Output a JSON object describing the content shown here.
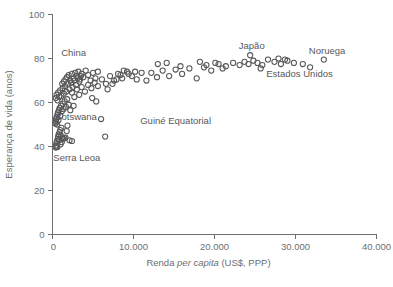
{
  "chart_data": {
    "type": "scatter",
    "title": "",
    "xlabel_parts": {
      "pre": "Renda ",
      "italic": "per capita",
      "post": " (US$, PPP)"
    },
    "xlabel": "Renda per capita (US$, PPP)",
    "ylabel": "Esperança de vida (anos)",
    "xlim": [
      0,
      40000
    ],
    "ylim": [
      0,
      100
    ],
    "xticks": [
      0,
      10000,
      20000,
      30000,
      40000
    ],
    "xtick_labels": [
      "0",
      "10.000",
      "20.000",
      "30.000",
      "40.000"
    ],
    "yticks": [
      0,
      20,
      40,
      60,
      80,
      100
    ],
    "ytick_labels": [
      "0",
      "20",
      "40",
      "60",
      "80",
      "100"
    ],
    "grid": false,
    "legend": "none",
    "marker": {
      "shape": "open-circle",
      "radius": 2.6,
      "stroke_color": "#58585a",
      "fill": "none"
    },
    "axis_color": "#6d6e70",
    "text_color": "#58585a",
    "background_color": "#ffffff",
    "annotations": [
      {
        "name": "china-label",
        "text": "China",
        "x": 2600,
        "y": 82.5
      },
      {
        "name": "botswana-label",
        "text": "Botswana",
        "x": 2900,
        "y": 53.5
      },
      {
        "name": "guine-equatorial-label",
        "text": "Guiné Equatorial",
        "x": 15200,
        "y": 51.5
      },
      {
        "name": "japao-label",
        "text": "Japão",
        "x": 24600,
        "y": 85.5
      },
      {
        "name": "noruega-label",
        "text": "Noruega",
        "x": 33900,
        "y": 83.5
      },
      {
        "name": "estados-unidos-label",
        "text": "Estados Unidos",
        "x": 30500,
        "y": 73.0
      },
      {
        "name": "serra-leoa-label",
        "text": "Serra Leoa",
        "x": 3000,
        "y": 35.0
      }
    ],
    "points": [
      [
        400,
        39.5
      ],
      [
        450,
        40.5
      ],
      [
        480,
        41.5
      ],
      [
        520,
        40.0
      ],
      [
        560,
        42.5
      ],
      [
        600,
        39.8
      ],
      [
        650,
        43.5
      ],
      [
        700,
        44.5
      ],
      [
        760,
        45.5
      ],
      [
        820,
        43.0
      ],
      [
        880,
        46.5
      ],
      [
        950,
        47.5
      ],
      [
        1020,
        45.0
      ],
      [
        1100,
        48.5
      ],
      [
        1180,
        44.0
      ],
      [
        1300,
        43.5
      ],
      [
        1450,
        43.8
      ],
      [
        1600,
        44.0
      ],
      [
        1750,
        47.0
      ],
      [
        1850,
        49.5
      ],
      [
        350,
        50.5
      ],
      [
        400,
        51.5
      ],
      [
        430,
        52.5
      ],
      [
        470,
        51.0
      ],
      [
        520,
        53.5
      ],
      [
        570,
        50.0
      ],
      [
        620,
        54.5
      ],
      [
        680,
        55.5
      ],
      [
        740,
        52.0
      ],
      [
        800,
        56.5
      ],
      [
        880,
        57.5
      ],
      [
        960,
        54.0
      ],
      [
        1050,
        58.5
      ],
      [
        1150,
        56.0
      ],
      [
        1250,
        59.5
      ],
      [
        1380,
        57.0
      ],
      [
        1500,
        60.5
      ],
      [
        1650,
        58.0
      ],
      [
        1800,
        61.5
      ],
      [
        2000,
        59.0
      ],
      [
        400,
        62.0
      ],
      [
        500,
        63.5
      ],
      [
        600,
        61.0
      ],
      [
        700,
        64.5
      ],
      [
        820,
        62.5
      ],
      [
        950,
        65.5
      ],
      [
        1100,
        63.0
      ],
      [
        1250,
        66.5
      ],
      [
        1400,
        64.0
      ],
      [
        1550,
        67.5
      ],
      [
        1700,
        65.0
      ],
      [
        1900,
        68.5
      ],
      [
        2100,
        66.0
      ],
      [
        2300,
        69.0
      ],
      [
        2500,
        67.0
      ],
      [
        2700,
        70.0
      ],
      [
        2900,
        68.0
      ],
      [
        3100,
        71.0
      ],
      [
        3300,
        69.5
      ],
      [
        3500,
        72.0
      ],
      [
        1200,
        68.5
      ],
      [
        1400,
        69.5
      ],
      [
        1600,
        70.5
      ],
      [
        1800,
        71.5
      ],
      [
        2000,
        72.5
      ],
      [
        2200,
        70.0
      ],
      [
        2400,
        73.0
      ],
      [
        2600,
        71.0
      ],
      [
        2800,
        73.5
      ],
      [
        3000,
        72.0
      ],
      [
        3200,
        74.0
      ],
      [
        3400,
        70.5
      ],
      [
        3600,
        73.0
      ],
      [
        3800,
        71.5
      ],
      [
        4100,
        74.5
      ],
      [
        4400,
        72.5
      ],
      [
        4700,
        70.0
      ],
      [
        5000,
        73.5
      ],
      [
        5300,
        71.0
      ],
      [
        5600,
        74.0
      ],
      [
        2400,
        64.5
      ],
      [
        2700,
        62.5
      ],
      [
        3000,
        66.0
      ],
      [
        3300,
        63.5
      ],
      [
        3600,
        67.0
      ],
      [
        4000,
        65.0
      ],
      [
        4400,
        68.0
      ],
      [
        4800,
        66.5
      ],
      [
        5200,
        69.0
      ],
      [
        5600,
        67.5
      ],
      [
        6100,
        70.5
      ],
      [
        6600,
        68.5
      ],
      [
        7100,
        72.0
      ],
      [
        7600,
        70.0
      ],
      [
        8100,
        73.0
      ],
      [
        8600,
        71.0
      ],
      [
        9200,
        74.0
      ],
      [
        9800,
        72.0
      ],
      [
        10400,
        70.5
      ],
      [
        11000,
        73.5
      ],
      [
        6000,
        52.5
      ],
      [
        6500,
        44.5
      ],
      [
        8800,
        74.5
      ],
      [
        9400,
        73.0
      ],
      [
        10200,
        74.0
      ],
      [
        11600,
        70.0
      ],
      [
        12200,
        73.5
      ],
      [
        12900,
        71.5
      ],
      [
        13600,
        74.5
      ],
      [
        14400,
        72.0
      ],
      [
        15200,
        75.0
      ],
      [
        16000,
        73.0
      ],
      [
        16900,
        75.5
      ],
      [
        17800,
        71.0
      ],
      [
        18700,
        76.0
      ],
      [
        19600,
        74.5
      ],
      [
        20500,
        77.5
      ],
      [
        21400,
        76.5
      ],
      [
        22300,
        78.0
      ],
      [
        23100,
        77.0
      ],
      [
        23700,
        78.5
      ],
      [
        24200,
        77.5
      ],
      [
        24800,
        79.0
      ],
      [
        25300,
        78.0
      ],
      [
        25900,
        77.0
      ],
      [
        26600,
        79.5
      ],
      [
        27400,
        78.5
      ],
      [
        28200,
        77.5
      ],
      [
        29000,
        79.0
      ],
      [
        29800,
        78.0
      ],
      [
        24400,
        81.5
      ],
      [
        25700,
        75.5
      ],
      [
        27900,
        80.0
      ],
      [
        28700,
        79.5
      ],
      [
        18200,
        78.5
      ],
      [
        19000,
        77.0
      ],
      [
        20100,
        78.0
      ],
      [
        21000,
        75.5
      ],
      [
        13000,
        77.5
      ],
      [
        14100,
        78.0
      ],
      [
        15800,
        76.5
      ],
      [
        6800,
        66.0
      ],
      [
        7400,
        68.5
      ],
      [
        7900,
        70.5
      ],
      [
        8400,
        72.5
      ],
      [
        4900,
        62.0
      ],
      [
        5400,
        60.5
      ],
      [
        2200,
        56.5
      ],
      [
        2600,
        58.5
      ],
      [
        33500,
        79.5
      ],
      [
        30900,
        77.5
      ],
      [
        31800,
        76.0
      ],
      [
        1000,
        41.0
      ],
      [
        1150,
        42.0
      ],
      [
        2100,
        42.8
      ],
      [
        2400,
        42.5
      ]
    ]
  }
}
